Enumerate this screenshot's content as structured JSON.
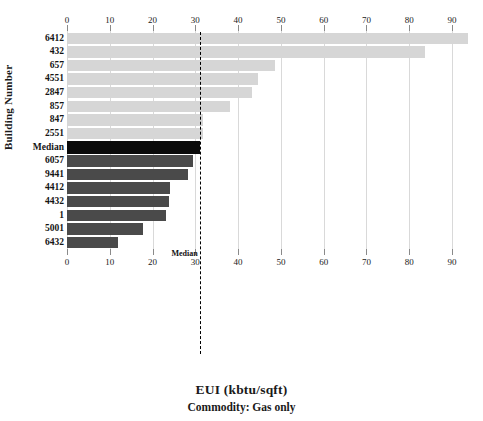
{
  "chart_data": {
    "type": "bar",
    "orientation": "horizontal",
    "title": "EUI (kbtu/sqft)",
    "subtitle": "Commodity: Gas only",
    "xlabel": "EUI (kbtu/sqft)",
    "ylabel": "Building Number",
    "xlim": [
      0,
      94
    ],
    "xticks": [
      0,
      10,
      20,
      30,
      40,
      50,
      60,
      70,
      80,
      90
    ],
    "xticklabels": [
      "0",
      "10",
      "20",
      "30",
      "40",
      "50",
      "60",
      "70",
      "80",
      "90"
    ],
    "grid": true,
    "legend": "none",
    "categories": [
      "6412",
      "432",
      "657",
      "4551",
      "2847",
      "857",
      "847",
      "2551",
      "Median",
      "6057",
      "9441",
      "4412",
      "4432",
      "1",
      "5001",
      "6432"
    ],
    "values": [
      93.8,
      83.6,
      48.6,
      44.6,
      43.2,
      38.0,
      31.8,
      31.8,
      31.0,
      29.4,
      28.3,
      24.0,
      23.8,
      23.1,
      17.8,
      11.9
    ],
    "bar_styles": [
      "light",
      "light",
      "light",
      "light",
      "light",
      "light",
      "light",
      "light",
      "median",
      "dark",
      "dark",
      "dark",
      "dark",
      "dark",
      "dark",
      "dark"
    ],
    "annotations": [
      {
        "name": "median-reference-line",
        "label": "Median",
        "value": 31.0,
        "style": "dashed-vertical-black"
      }
    ]
  },
  "colors": {
    "bar_light": "#d6d6d6",
    "bar_dark": "#4a4a4a",
    "bar_median": "#0a0a0a",
    "gridline": "#d9d9d9",
    "axis": "#8a8a8a",
    "text": "#141414",
    "background": "#ffffff"
  },
  "axis": {
    "y_title": "Building Number",
    "median_tick_label": "Median"
  }
}
